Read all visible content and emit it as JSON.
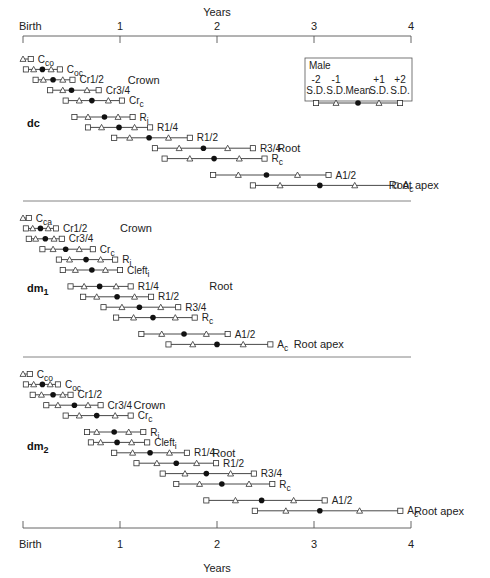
{
  "chart_data": {
    "type": "interval",
    "title": "",
    "xlabel": "Years",
    "x_ticks": [
      {
        "value": 0,
        "label": "Birth"
      },
      {
        "value": 1,
        "label": "1"
      },
      {
        "value": 2,
        "label": "2"
      },
      {
        "value": 3,
        "label": "3"
      },
      {
        "value": 4,
        "label": "4"
      }
    ],
    "xlim": [
      0,
      4
    ],
    "legend": {
      "title": "Male",
      "entries": [
        {
          "top": "-2",
          "bottom": "S.D.",
          "marker": "square"
        },
        {
          "top": "-1",
          "bottom": "S.D.",
          "marker": "triangle"
        },
        {
          "top": "",
          "bottom": "Mean",
          "marker": "dot"
        },
        {
          "top": "+1",
          "bottom": "S.D.",
          "marker": "triangle"
        },
        {
          "top": "+2",
          "bottom": "S.D.",
          "marker": "square"
        }
      ]
    },
    "value_order": [
      "-2SD",
      "-1SD",
      "mean",
      "+1SD",
      "+2SD"
    ],
    "panels": [
      {
        "name": "dc",
        "sub": "",
        "annotations": [
          {
            "text": "Crown",
            "x": 1.08,
            "row": 2
          },
          {
            "text": "Root",
            "x": 2.62,
            "row": 8
          },
          {
            "text": "Root apex",
            "x": 3.77,
            "row": 11
          }
        ],
        "stages": [
          {
            "label": "C",
            "sub": "co",
            "values": [
              null,
              0.0,
              null,
              null,
              0.08
            ]
          },
          {
            "label": "C",
            "sub": "oc",
            "values": [
              0.03,
              0.11,
              0.2,
              0.29,
              0.38
            ]
          },
          {
            "label": "Cr1/2",
            "sub": "",
            "values": [
              0.13,
              0.21,
              0.31,
              0.41,
              0.51
            ]
          },
          {
            "label": "Cr3/4",
            "sub": "",
            "values": [
              0.28,
              0.41,
              0.5,
              0.66,
              0.78
            ]
          },
          {
            "label": "Cr",
            "sub": "c",
            "values": [
              0.44,
              0.58,
              0.71,
              0.88,
              1.02
            ]
          },
          {
            "label": "R",
            "sub": "i",
            "values": [
              0.53,
              0.67,
              0.84,
              0.98,
              1.13
            ]
          },
          {
            "label": "R1/4",
            "sub": "",
            "values": [
              0.67,
              0.81,
              0.99,
              1.15,
              1.31
            ]
          },
          {
            "label": "R1/2",
            "sub": "",
            "values": [
              0.94,
              1.1,
              1.3,
              1.5,
              1.72
            ]
          },
          {
            "label": "R3/4",
            "sub": "",
            "values": [
              1.36,
              1.61,
              1.86,
              2.11,
              2.37
            ]
          },
          {
            "label": "R",
            "sub": "c",
            "values": [
              1.46,
              1.72,
              1.97,
              2.23,
              2.49
            ]
          },
          {
            "label": "A1/2",
            "sub": "",
            "values": [
              1.96,
              2.22,
              2.51,
              2.83,
              3.15
            ]
          },
          {
            "label": "A",
            "sub": "c",
            "values": [
              2.37,
              2.65,
              3.06,
              3.42,
              3.84
            ]
          }
        ]
      },
      {
        "name": "dm",
        "sub": "1",
        "annotations": [
          {
            "text": "Crown",
            "x": 1.0,
            "row": 1
          },
          {
            "text": "Root",
            "x": 1.92,
            "row": 6
          },
          {
            "text": "Root apex",
            "x": 2.79,
            "row": 12
          }
        ],
        "stages": [
          {
            "label": "C",
            "sub": "ca",
            "values": [
              null,
              0.0,
              null,
              null,
              0.06
            ]
          },
          {
            "label": "Cr1/2",
            "sub": "",
            "values": [
              0.03,
              0.1,
              0.18,
              0.26,
              0.34
            ]
          },
          {
            "label": "Cr3/4",
            "sub": "",
            "values": [
              0.06,
              0.13,
              0.23,
              0.32,
              0.4
            ]
          },
          {
            "label": "Cr",
            "sub": "c",
            "values": [
              0.2,
              0.31,
              0.44,
              0.58,
              0.72
            ]
          },
          {
            "label": "R",
            "sub": "i",
            "values": [
              0.37,
              0.48,
              0.65,
              0.8,
              0.95
            ]
          },
          {
            "label": "Cleft",
            "sub": "i",
            "values": [
              0.41,
              0.54,
              0.71,
              0.85,
              1.0
            ]
          },
          {
            "label": "R1/4",
            "sub": "",
            "values": [
              0.49,
              0.63,
              0.79,
              0.96,
              1.11
            ]
          },
          {
            "label": "R1/2",
            "sub": "",
            "values": [
              0.62,
              0.76,
              0.97,
              1.15,
              1.32
            ]
          },
          {
            "label": "R3/4",
            "sub": "",
            "values": [
              0.83,
              1.02,
              1.2,
              1.42,
              1.6
            ]
          },
          {
            "label": "R",
            "sub": "c",
            "values": [
              0.96,
              1.14,
              1.34,
              1.57,
              1.77
            ]
          },
          {
            "label": "A1/2",
            "sub": "",
            "values": [
              1.22,
              1.43,
              1.66,
              1.89,
              2.11
            ]
          },
          {
            "label": "A",
            "sub": "c",
            "values": [
              1.5,
              1.75,
              2.0,
              2.27,
              2.55
            ]
          }
        ]
      },
      {
        "name": "dm",
        "sub": "2",
        "annotations": [
          {
            "text": "Crown",
            "x": 1.14,
            "row": 3
          },
          {
            "text": "Root",
            "x": 1.95,
            "row": 7
          },
          {
            "text": "Root apex",
            "x": 4.03,
            "row": 13
          }
        ],
        "stages": [
          {
            "label": "C",
            "sub": "co",
            "values": [
              null,
              0.0,
              null,
              null,
              0.07
            ]
          },
          {
            "label": "C",
            "sub": "oc",
            "values": [
              0.03,
              0.11,
              0.2,
              0.28,
              0.36
            ]
          },
          {
            "label": "Cr1/2",
            "sub": "",
            "values": [
              0.1,
              0.19,
              0.31,
              0.41,
              0.49
            ]
          },
          {
            "label": "Cr3/4",
            "sub": "",
            "values": [
              0.24,
              0.36,
              0.53,
              0.67,
              0.8
            ]
          },
          {
            "label": "Cr",
            "sub": "c",
            "values": [
              0.44,
              0.58,
              0.76,
              0.95,
              1.11
            ]
          },
          {
            "label": "R",
            "sub": "i",
            "values": [
              0.66,
              0.76,
              0.94,
              1.09,
              1.24
            ]
          },
          {
            "label": "Cleft",
            "sub": "i",
            "values": [
              0.7,
              0.8,
              0.97,
              1.12,
              1.28
            ]
          },
          {
            "label": "R1/4",
            "sub": "",
            "values": [
              0.94,
              1.13,
              1.31,
              1.51,
              1.69
            ]
          },
          {
            "label": "R1/2",
            "sub": "",
            "values": [
              1.17,
              1.38,
              1.58,
              1.79,
              1.99
            ]
          },
          {
            "label": "R3/4",
            "sub": "",
            "values": [
              1.44,
              1.67,
              1.89,
              2.14,
              2.38
            ]
          },
          {
            "label": "R",
            "sub": "c",
            "values": [
              1.58,
              1.82,
              2.05,
              2.33,
              2.57
            ]
          },
          {
            "label": "A1/2",
            "sub": "",
            "values": [
              1.89,
              2.19,
              2.46,
              2.79,
              3.11
            ]
          },
          {
            "label": "A",
            "sub": "c",
            "values": [
              2.39,
              2.71,
              3.06,
              3.47,
              3.89
            ]
          }
        ]
      }
    ]
  },
  "layout": {
    "x0_px": 23,
    "px_per_year": 97,
    "top_axis_y": 36,
    "bottom_axis_y": 528,
    "separators_y": [
      201,
      357
    ],
    "panel_first_row_y": [
      59,
      218,
      374
    ],
    "panel_label_y": [
      127,
      292,
      450
    ],
    "row_gap": [
      10.4,
      10.4,
      10.4
    ],
    "extra_gap_after_row": [
      4,
      5,
      4
    ],
    "extra_gap_size": [
      6,
      8,
      6,
      8
    ]
  }
}
